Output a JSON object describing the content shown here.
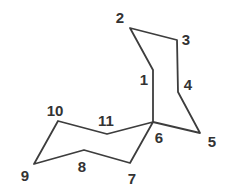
{
  "diagram": {
    "type": "chemical-structure",
    "molecule": "spiro[5.5]undecane numbered carbon skeleton",
    "background": "#ffffff",
    "stroke_color": "#3d3d3d",
    "label_color": "#333333",
    "stroke_width": 1.8,
    "canvas": {
      "width": 225,
      "height": 189
    },
    "atoms": [
      {
        "n": "1",
        "x": 153,
        "y": 70,
        "lx": 144,
        "ly": 79
      },
      {
        "n": "2",
        "x": 130,
        "y": 28,
        "lx": 120,
        "ly": 17
      },
      {
        "n": "3",
        "x": 177,
        "y": 40,
        "lx": 186,
        "ly": 39
      },
      {
        "n": "4",
        "x": 178,
        "y": 92,
        "lx": 188,
        "ly": 84
      },
      {
        "n": "5",
        "x": 200,
        "y": 133,
        "lx": 212,
        "ly": 141
      },
      {
        "n": "6",
        "x": 153,
        "y": 122,
        "lx": 159,
        "ly": 137
      },
      {
        "n": "7",
        "x": 130,
        "y": 163,
        "lx": 132,
        "ly": 178
      },
      {
        "n": "8",
        "x": 84,
        "y": 150,
        "lx": 82,
        "ly": 166
      },
      {
        "n": "9",
        "x": 34,
        "y": 164,
        "lx": 25,
        "ly": 175
      },
      {
        "n": "10",
        "x": 58,
        "y": 121,
        "lx": 55,
        "ly": 110
      },
      {
        "n": "11",
        "x": 107,
        "y": 134,
        "lx": 106,
        "ly": 120
      }
    ],
    "rings": [
      {
        "name": "cyclohexane-ring-top",
        "atoms": [
          "1",
          "2",
          "3",
          "4",
          "5",
          "6"
        ]
      },
      {
        "name": "cyclohexane-ring-bottom",
        "atoms": [
          "6",
          "7",
          "8",
          "9",
          "10",
          "11"
        ]
      }
    ]
  }
}
